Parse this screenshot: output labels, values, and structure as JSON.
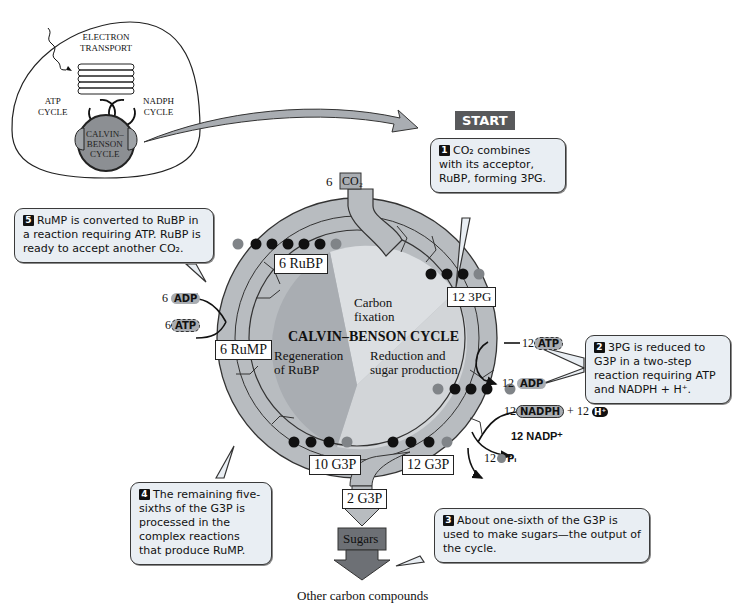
{
  "inset": {
    "electron_transport": [
      "ELECTRON",
      "TRANSPORT"
    ],
    "atp_cycle": [
      "ATP",
      "CYCLE"
    ],
    "nadph_cycle": [
      "NADPH",
      "CYCLE"
    ],
    "calvin_benson": [
      "CALVIN–",
      "BENSON",
      "CYCLE"
    ]
  },
  "start_label": "START",
  "cycle": {
    "title": "CALVIN–BENSON CYCLE",
    "sectors": {
      "carbon_fixation": [
        "Carbon",
        "fixation"
      ],
      "reduction": [
        "Reduction and",
        "sugar production"
      ],
      "regeneration": [
        "Regeneration",
        "of RuBP"
      ]
    }
  },
  "molecules": {
    "co2": {
      "count": "6",
      "name": "CO₂"
    },
    "rubp": "6 RuBP",
    "pg3": "12 3PG",
    "rump": "6 RuMP",
    "g3p_10": "10 G3P",
    "g3p_12": "12 G3P",
    "g3p_2": "2 G3P",
    "sugars": "Sugars",
    "other": "Other carbon compounds"
  },
  "cofactors": {
    "left_adp": {
      "count": "6",
      "name": "ADP"
    },
    "left_atp": {
      "count": "6",
      "name": "ATP"
    },
    "right_atp": {
      "count": "12",
      "name": "ATP"
    },
    "right_adp": {
      "count": "12",
      "name": "ADP"
    },
    "nadph": {
      "count": "12",
      "name": "NADPH"
    },
    "h_plus": {
      "count": "+ 12",
      "name": "H⁺"
    },
    "nadp": "12 NADP⁺",
    "pi": {
      "count": "12",
      "name": "Pᵢ"
    }
  },
  "atoms": {
    "carbon": "C",
    "phosphate": "P"
  },
  "callouts": [
    {
      "num": "1",
      "text": "CO₂ combines with its acceptor, RuBP, forming 3PG."
    },
    {
      "num": "2",
      "text": "3PG is reduced to G3P in a two-step reaction requiring ATP and NADPH + H⁺."
    },
    {
      "num": "3",
      "text": "About one-sixth of the G3P is used to make sugars—the output of the cycle."
    },
    {
      "num": "4",
      "text": "The remaining five-sixths of the G3P is processed in the complex reactions that produce RuMP."
    },
    {
      "num": "5",
      "text": "RuMP is converted to RuBP in a reaction requiring ATP.  RuBP is ready to accept another CO₂."
    }
  ],
  "colors": {
    "ring": "#b8bcc0",
    "sector_fixation": "#dcdfe2",
    "sector_reduction": "#d2d5d8",
    "sector_regeneration": "#a9adb2",
    "inset_cycle": "#8c8f93",
    "callout_bg": "#e9eef3",
    "start_bg": "#58595b",
    "sugars_bg": "#6d7075"
  }
}
